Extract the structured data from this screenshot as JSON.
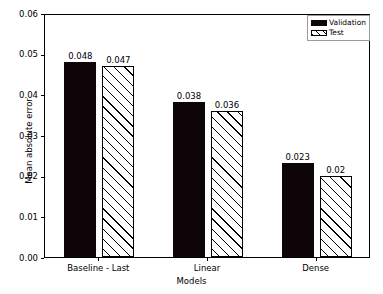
{
  "chart_data": {
    "type": "bar",
    "title": "",
    "subtitle": "",
    "xlabel": "Models",
    "ylabel": "Mean absolute error",
    "categories": [
      "Baseline - Last",
      "Linear",
      "Dense"
    ],
    "series": [
      {
        "name": "Validation",
        "values": [
          0.048,
          0.038,
          0.023
        ],
        "labels": [
          "0.048",
          "0.038",
          "0.023"
        ],
        "style": "solid-black",
        "color": "#000000"
      },
      {
        "name": "Test",
        "values": [
          0.047,
          0.036,
          0.02
        ],
        "labels": [
          "0.047",
          "0.036",
          "0.02"
        ],
        "style": "white-diagonal-hatch",
        "color": "#ffffff",
        "edge_color": "#000000"
      }
    ],
    "ylim": [
      0.0,
      0.06
    ],
    "yticks": [
      0.0,
      0.01,
      0.02,
      0.03,
      0.04,
      0.05,
      0.06
    ],
    "ytick_labels": [
      "0.00",
      "0.01",
      "0.02",
      "0.03",
      "0.04",
      "0.05",
      "0.06"
    ],
    "grid": false,
    "legend_position": "upper right",
    "legend_entries": [
      "Validation",
      "Test"
    ]
  },
  "axes": {
    "y_axis_title": "Mean absolute error",
    "x_axis_title": "Models"
  },
  "legend": {
    "items": [
      {
        "label": "Validation",
        "swatch": "solid-black-swatch"
      },
      {
        "label": "Test",
        "swatch": "hatched-white-swatch"
      }
    ]
  }
}
